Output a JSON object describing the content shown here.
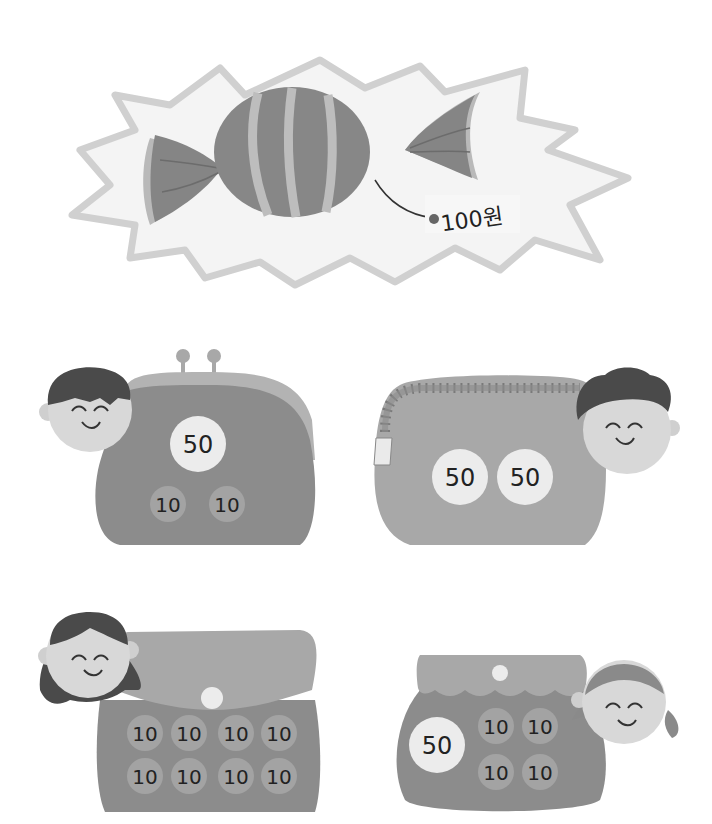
{
  "illustration": {
    "candy": {
      "price_tag": "100원",
      "colors": {
        "burst_fill": "#f2f2f2",
        "burst_outline": "#cfcfcf",
        "candy_body": "#8a8a8a",
        "stripes": "#bdbdbd",
        "wrapper_shadow": "#b8b8b8"
      }
    },
    "purses": [
      {
        "id": "purse-1",
        "style": "clasp-purse",
        "coins": [
          "50",
          "10",
          "10"
        ],
        "child": "boy-straight-hair"
      },
      {
        "id": "purse-2",
        "style": "zipper-pouch",
        "coins": [
          "50",
          "50"
        ],
        "child": "boy-curly-hair"
      },
      {
        "id": "purse-3",
        "style": "flap-bag",
        "coins": [
          "10",
          "10",
          "10",
          "10",
          "10",
          "10",
          "10",
          "10"
        ],
        "child": "girl-long-hair"
      },
      {
        "id": "purse-4",
        "style": "scallop-pouch",
        "coins": [
          "50",
          "10",
          "10",
          "10",
          "10"
        ],
        "child": "girl-pigtails"
      }
    ],
    "colors": {
      "purse_dark": "#8c8c8c",
      "purse_light": "#a8a8a8",
      "coin_50": "#ececec",
      "coin_10": "#a3a3a3",
      "skin": "#d8d8d8",
      "hair": "#4a4a4a"
    }
  }
}
